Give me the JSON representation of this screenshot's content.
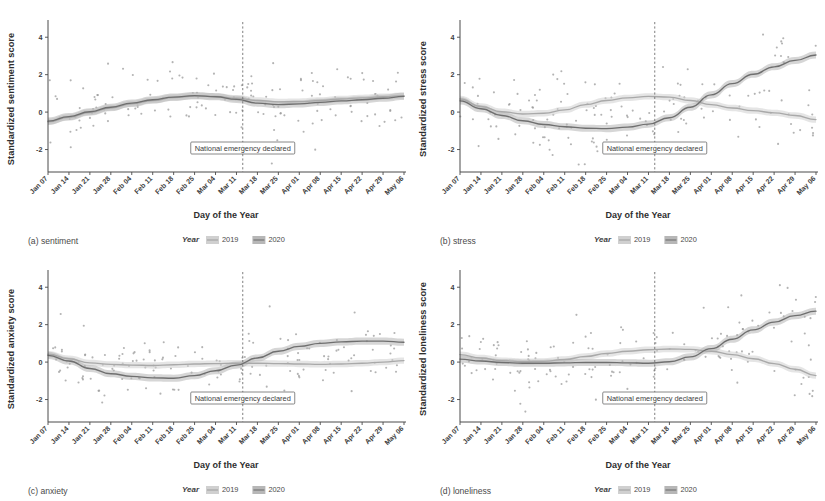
{
  "figure": {
    "background": "#ffffff",
    "panel_count": 4
  },
  "axes": {
    "xlabel": "Day of the Year",
    "x_ticks": [
      "Jan 07",
      "Jan 14",
      "Jan 21",
      "Jan 28",
      "Feb 04",
      "Feb 11",
      "Feb 18",
      "Feb 25",
      "Mar 04",
      "Mar 11",
      "Mar 18",
      "Mar 25",
      "Apr 01",
      "Apr 08",
      "Apr 15",
      "Apr 22",
      "Apr 29",
      "May 06"
    ],
    "y_ticks": [
      "4",
      "2",
      "0",
      "-2"
    ],
    "ylim": [
      -3.2,
      4.6
    ]
  },
  "legend": {
    "title": "Year",
    "entries": [
      {
        "label": "2019",
        "color": "#a9a9a9"
      },
      {
        "label": "2020",
        "color": "#7b7b7b"
      }
    ]
  },
  "annotation": {
    "text": "National emergency declared",
    "x_index": 9.3
  },
  "colors": {
    "series_2019": "#a9a9a9",
    "series_2020": "#6f6f6f",
    "ribbon_2019": "#cfcfcf",
    "ribbon_2020": "#b4b4b4",
    "point": "#9a9a9a",
    "axis": "#4a4a4a",
    "annotation_line": "#6f6f6f"
  },
  "chart_data": [
    {
      "type": "line",
      "panel": "a",
      "caption": "(a) sentiment",
      "ylabel": "Standardized sentiment score",
      "xlabel": "Day of the Year",
      "ylim": [
        -3.2,
        4.6
      ],
      "grid": false,
      "legend_position": "bottom",
      "x": [
        "Jan 07",
        "Jan 14",
        "Jan 21",
        "Jan 28",
        "Feb 04",
        "Feb 11",
        "Feb 18",
        "Feb 25",
        "Mar 04",
        "Mar 11",
        "Mar 18",
        "Mar 25",
        "Apr 01",
        "Apr 08",
        "Apr 15",
        "Apr 22",
        "Apr 29",
        "May 06"
      ],
      "series": [
        {
          "name": "2019",
          "values": [
            -0.52,
            -0.28,
            -0.02,
            0.22,
            0.44,
            0.62,
            0.78,
            0.86,
            0.84,
            0.74,
            0.62,
            0.55,
            0.56,
            0.62,
            0.7,
            0.76,
            0.82,
            0.88
          ]
        },
        {
          "name": "2020",
          "values": [
            -0.48,
            -0.24,
            0.02,
            0.26,
            0.48,
            0.66,
            0.8,
            0.88,
            0.82,
            0.68,
            0.48,
            0.4,
            0.44,
            0.52,
            0.6,
            0.66,
            0.74,
            0.84
          ]
        }
      ],
      "scatter_seed": 11,
      "scatter_spread": 0.88,
      "scatter_n": 150
    },
    {
      "type": "line",
      "panel": "b",
      "caption": "(b) stress",
      "ylabel": "Standardized stress score",
      "xlabel": "Day of the Year",
      "ylim": [
        -3.2,
        4.6
      ],
      "grid": false,
      "legend_position": "bottom",
      "x": [
        "Jan 07",
        "Jan 14",
        "Jan 21",
        "Jan 28",
        "Feb 04",
        "Feb 11",
        "Feb 18",
        "Feb 25",
        "Mar 04",
        "Mar 11",
        "Mar 18",
        "Mar 25",
        "Apr 01",
        "Apr 08",
        "Apr 15",
        "Apr 22",
        "Apr 29",
        "May 06"
      ],
      "series": [
        {
          "name": "2019",
          "values": [
            0.7,
            0.3,
            0.02,
            -0.1,
            -0.06,
            0.12,
            0.4,
            0.62,
            0.76,
            0.84,
            0.8,
            0.62,
            0.4,
            0.22,
            0.08,
            -0.04,
            -0.18,
            -0.4
          ]
        },
        {
          "name": "2020",
          "values": [
            0.6,
            0.18,
            -0.18,
            -0.46,
            -0.66,
            -0.78,
            -0.86,
            -0.88,
            -0.8,
            -0.64,
            -0.3,
            0.26,
            0.92,
            1.52,
            2.02,
            2.42,
            2.76,
            3.05
          ]
        }
      ],
      "scatter_seed": 29,
      "scatter_spread": 1.05,
      "scatter_n": 150
    },
    {
      "type": "line",
      "panel": "c",
      "caption": "(c) anxiety",
      "ylabel": "Standardized anxiety score",
      "xlabel": "Day of the Year",
      "ylim": [
        -3.2,
        4.6
      ],
      "grid": false,
      "legend_position": "bottom",
      "x": [
        "Jan 07",
        "Jan 14",
        "Jan 21",
        "Jan 28",
        "Feb 04",
        "Feb 11",
        "Feb 18",
        "Feb 25",
        "Mar 04",
        "Mar 11",
        "Mar 18",
        "Mar 25",
        "Apr 01",
        "Apr 08",
        "Apr 15",
        "Apr 22",
        "Apr 29",
        "May 06"
      ],
      "series": [
        {
          "name": "2019",
          "values": [
            0.42,
            0.18,
            -0.04,
            -0.12,
            -0.16,
            -0.18,
            -0.14,
            -0.1,
            -0.08,
            -0.06,
            -0.06,
            -0.08,
            -0.1,
            -0.12,
            -0.1,
            -0.06,
            0.0,
            0.08
          ]
        },
        {
          "name": "2020",
          "values": [
            0.36,
            0.06,
            -0.34,
            -0.62,
            -0.76,
            -0.84,
            -0.86,
            -0.72,
            -0.46,
            -0.16,
            0.22,
            0.58,
            0.84,
            1.0,
            1.08,
            1.12,
            1.12,
            1.06
          ]
        }
      ],
      "scatter_seed": 47,
      "scatter_spread": 0.8,
      "scatter_n": 150
    },
    {
      "type": "line",
      "panel": "d",
      "caption": "(d) loneliness",
      "ylabel": "Standardized loneliness score",
      "xlabel": "Day of the Year",
      "ylim": [
        -3.2,
        4.6
      ],
      "grid": false,
      "legend_position": "bottom",
      "x": [
        "Jan 07",
        "Jan 14",
        "Jan 21",
        "Jan 28",
        "Feb 04",
        "Feb 11",
        "Feb 18",
        "Feb 25",
        "Mar 04",
        "Mar 11",
        "Mar 18",
        "Mar 25",
        "Apr 01",
        "Apr 08",
        "Apr 15",
        "Apr 22",
        "Apr 29",
        "May 06"
      ],
      "series": [
        {
          "name": "2019",
          "values": [
            0.4,
            0.22,
            0.08,
            0.02,
            0.04,
            0.14,
            0.3,
            0.46,
            0.58,
            0.66,
            0.7,
            0.68,
            0.58,
            0.4,
            0.18,
            -0.08,
            -0.38,
            -0.72
          ]
        },
        {
          "name": "2020",
          "values": [
            0.16,
            0.06,
            -0.02,
            -0.06,
            -0.06,
            -0.04,
            -0.02,
            -0.02,
            -0.04,
            -0.06,
            0.02,
            0.28,
            0.72,
            1.22,
            1.72,
            2.14,
            2.48,
            2.72
          ]
        }
      ],
      "scatter_seed": 67,
      "scatter_spread": 0.92,
      "scatter_n": 150
    }
  ]
}
